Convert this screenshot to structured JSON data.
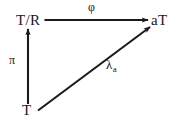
{
  "diagram": {
    "kind": "commutative-diagram",
    "background_color": "#ffffff",
    "ink_color": "#1a1a1a",
    "width": 179,
    "height": 121,
    "nodes": [
      {
        "id": "tr",
        "label": "T/R",
        "x": 16,
        "y": 13,
        "position": "top-left"
      },
      {
        "id": "at",
        "label": "aT",
        "x": 151,
        "y": 13,
        "position": "top-right"
      },
      {
        "id": "t",
        "label": "T",
        "x": 22,
        "y": 103,
        "position": "bottom-left"
      }
    ],
    "edges": [
      {
        "id": "phi",
        "label": "φ",
        "from": "tr",
        "to": "at",
        "orientation": "horizontal",
        "label_x": 88,
        "label_y": 1,
        "arrowhead": "end"
      },
      {
        "id": "pi",
        "label": "π",
        "from": "t",
        "to": "tr",
        "orientation": "vertical",
        "label_x": 9,
        "label_y": 54,
        "arrowhead": "end"
      },
      {
        "id": "lambda-a",
        "label": "λ",
        "subscript": "a",
        "from": "t",
        "to": "at",
        "orientation": "diagonal",
        "label_x": 106,
        "label_y": 58,
        "arrowhead": "end"
      }
    ]
  }
}
